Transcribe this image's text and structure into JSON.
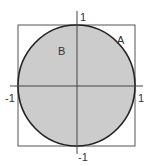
{
  "diagram": {
    "colors": {
      "circle_fill": "#cccccc",
      "circle_stroke": "#222222",
      "square_stroke": "#555555",
      "axis_stroke": "#444444",
      "background": "#ffffff"
    },
    "labels": {
      "region_outside": "A",
      "region_inside": "B",
      "x_pos": "1",
      "x_neg": "-1",
      "y_pos": "1",
      "y_neg": "-1"
    }
  }
}
